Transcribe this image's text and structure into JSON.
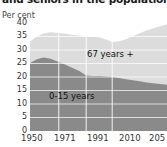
{
  "title": "and seniors in the population",
  "chart_data": {
    "type": "area",
    "stacked": true,
    "title": "and seniors in the population",
    "xlabel": "",
    "ylabel": "Per cent",
    "ylim": [
      0,
      40
    ],
    "xlim": [
      1950,
      2050
    ],
    "grid": true,
    "y_ticks": [
      0,
      5,
      10,
      15,
      20,
      25,
      30,
      35,
      40
    ],
    "y_tick_labels": [
      "0",
      "5",
      "10",
      "15",
      "20",
      "25",
      "30",
      "35",
      "40"
    ],
    "x_ticks": [
      1950,
      1971,
      1991,
      2010,
      2050
    ],
    "x_tick_labels": [
      "1950",
      "1971",
      "1991",
      "2010",
      "205"
    ],
    "x_tick_labels_full": [
      "1950",
      "1971",
      "1991",
      "2010",
      "2050"
    ],
    "legend_position": "in-plot",
    "x": [
      1950,
      1955,
      1960,
      1965,
      1971,
      1976,
      1981,
      1986,
      1991,
      1996,
      2001,
      2006,
      2010,
      2015,
      2020,
      2025,
      2030,
      2035,
      2040,
      2045,
      2050
    ],
    "series": [
      {
        "name": "0-15 years",
        "color": "#8a8a8a",
        "label": "0-15 years",
        "values": [
          25.2,
          26.6,
          27.2,
          26.8,
          25.6,
          24.5,
          23.3,
          22.2,
          20.6,
          20.4,
          20.4,
          20.2,
          20.0,
          19.6,
          19.2,
          18.8,
          18.4,
          18.0,
          17.7,
          17.4,
          17.1
        ]
      },
      {
        "name": "67 years +",
        "color": "#dcdcdc",
        "label": "67 years +",
        "values": [
          7.9,
          8.4,
          8.9,
          9.8,
          10.7,
          11.5,
          12.3,
          13.2,
          14.3,
          14.5,
          14.2,
          13.6,
          13.0,
          13.6,
          14.8,
          16.3,
          17.8,
          19.2,
          20.4,
          21.4,
          22.4
        ]
      }
    ],
    "totals": [
      33.1,
      35.0,
      36.1,
      36.6,
      36.3,
      36.0,
      35.6,
      35.4,
      34.9,
      34.9,
      34.6,
      33.8,
      33.0,
      33.2,
      34.0,
      35.1,
      36.2,
      37.2,
      38.1,
      38.8,
      39.5
    ]
  }
}
